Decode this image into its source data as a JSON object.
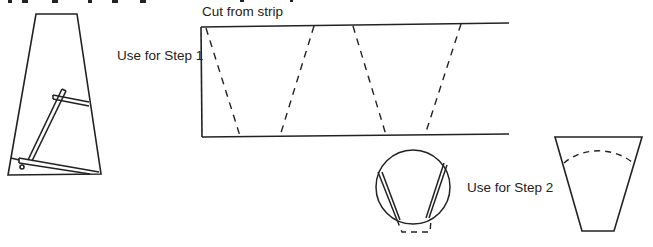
{
  "labels": {
    "cut_from_strip": "Cut from strip",
    "use_step1": "Use for Step 1",
    "use_step2": "Use for Step 2"
  },
  "colors": {
    "stroke": "#222222",
    "background": "#ffffff"
  }
}
